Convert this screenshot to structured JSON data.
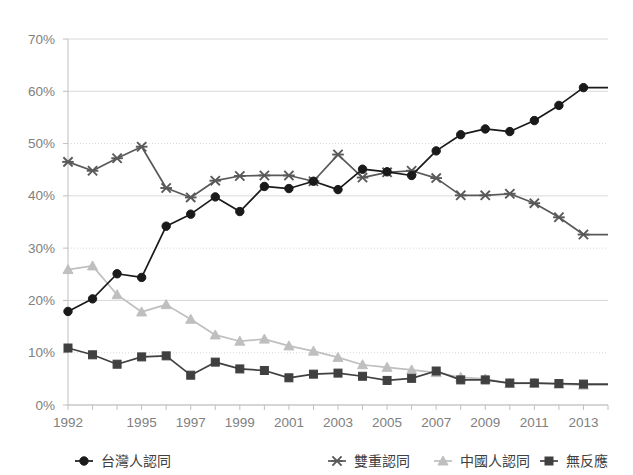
{
  "chart_data": {
    "type": "line",
    "title": "",
    "subtitle": "",
    "xlabel": "",
    "ylabel": "",
    "ylim": [
      0,
      70
    ],
    "ytick_labels": [
      "0%",
      "10%",
      "20%",
      "30%",
      "40%",
      "50%",
      "60%",
      "70%"
    ],
    "ytick_values": [
      0,
      10,
      20,
      30,
      40,
      50,
      60,
      70
    ],
    "grid": true,
    "legend_position": "bottom",
    "x": [
      1992,
      1993,
      1994,
      1995,
      1996,
      1997,
      1998,
      1999,
      2000,
      2001,
      2002,
      2003,
      2004,
      2005,
      2006,
      2007,
      2008,
      2009,
      2010,
      2011,
      2012,
      2013,
      2014
    ],
    "xtick_labels": [
      "1992",
      "",
      "",
      "1995",
      "",
      "1997",
      "",
      "1999",
      "",
      "2001",
      "",
      "2003",
      "",
      "2005",
      "",
      "2007",
      "",
      "2009",
      "",
      "2011",
      "",
      "2013",
      ""
    ],
    "series": [
      {
        "name": "台灣人認同",
        "marker": "circle",
        "color": "#1a1a1a",
        "values": [
          17.9,
          20.3,
          25.1,
          24.4,
          34.2,
          36.5,
          39.8,
          37.0,
          41.8,
          41.4,
          42.8,
          41.2,
          45.1,
          44.6,
          43.9,
          48.6,
          51.7,
          52.8,
          52.3,
          54.4,
          57.3,
          60.7,
          60.7
        ]
      },
      {
        "name": "雙重認同",
        "marker": "x",
        "color": "#595959",
        "values": [
          46.5,
          44.8,
          47.2,
          49.4,
          41.5,
          39.7,
          42.9,
          43.8,
          43.9,
          43.9,
          42.8,
          47.9,
          43.5,
          44.5,
          44.8,
          43.4,
          40.1,
          40.1,
          40.4,
          38.6,
          35.9,
          32.6,
          32.6
        ]
      },
      {
        "name": "中國人認同",
        "marker": "triangle",
        "color": "#bfbfbf",
        "values": [
          25.9,
          26.6,
          21.1,
          17.8,
          19.2,
          16.4,
          13.4,
          12.2,
          12.6,
          11.3,
          10.3,
          9.1,
          7.7,
          7.2,
          6.7,
          6.2,
          5.3,
          5.0,
          4.1,
          4.2,
          4.0,
          3.8,
          3.8
        ]
      },
      {
        "name": "無反應",
        "marker": "square",
        "color": "#404040",
        "values": [
          10.9,
          9.6,
          7.8,
          9.2,
          9.4,
          5.7,
          8.2,
          6.9,
          6.6,
          5.2,
          5.9,
          6.1,
          5.5,
          4.7,
          5.1,
          6.5,
          4.8,
          4.8,
          4.2,
          4.2,
          4.1,
          4.0,
          4.0
        ]
      }
    ]
  },
  "legend": {
    "items": [
      {
        "label": "台灣人認同",
        "marker": "circle",
        "color": "#1a1a1a"
      },
      {
        "label": "雙重認同",
        "marker": "x",
        "color": "#595959"
      },
      {
        "label": "中國人認同",
        "marker": "triangle",
        "color": "#bfbfbf"
      },
      {
        "label": "無反應",
        "marker": "square",
        "color": "#404040"
      }
    ]
  },
  "colors": {
    "grid": "#d9d9d9",
    "axis": "#bfbfbf",
    "tick_text": "#808080",
    "legend_text": "#404040",
    "background": "#ffffff"
  },
  "geometry": {
    "plot_left": 68,
    "plot_right": 608,
    "plot_top": 39,
    "plot_bottom": 405
  }
}
